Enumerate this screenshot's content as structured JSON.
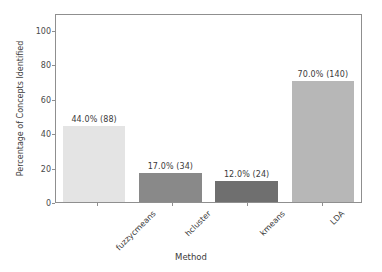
{
  "chart_data": {
    "type": "bar",
    "title": "",
    "subtitle": "",
    "xlabel": "Method",
    "ylabel": "Percentage of Concepts Identified",
    "categories": [
      "fuzzycmeans",
      "hcluster",
      "kmeans",
      "LDA"
    ],
    "values": [
      44.0,
      17.0,
      12.0,
      70.0
    ],
    "counts": [
      88,
      34,
      24,
      140
    ],
    "bar_labels": [
      "44.0% (88)",
      "17.0% (34)",
      "12.0% (24)",
      "70.0% (140)"
    ],
    "bar_colors": [
      "#e4e4e4",
      "#898989",
      "#6f6f6f",
      "#b7b7b7"
    ],
    "ylim": [
      0,
      108
    ],
    "yticks": [
      0,
      20,
      40,
      60,
      80,
      100
    ],
    "ytick_labels": [
      "0",
      "20",
      "40",
      "60",
      "80",
      "100"
    ],
    "xtick_rotation": -45,
    "grid": false,
    "legend": null,
    "axis_color": "#8f8f8f",
    "background_color": "#ffffff",
    "text_color": "#3b3b3b"
  }
}
